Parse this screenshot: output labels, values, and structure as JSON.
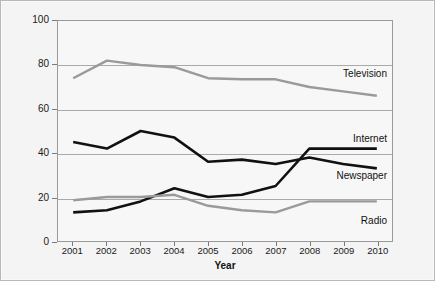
{
  "chart_data": {
    "type": "line",
    "title": "",
    "xlabel": "Year",
    "ylabel": "Percentage",
    "categories": [
      "2001",
      "2002",
      "2003",
      "2004",
      "2005",
      "2006",
      "2007",
      "2008",
      "2009",
      "2010"
    ],
    "x": [
      2001,
      2002,
      2003,
      2004,
      2005,
      2006,
      2007,
      2008,
      2009,
      2010
    ],
    "xlim": [
      2000.55,
      2010.45
    ],
    "ylim": [
      0,
      100
    ],
    "yticks": [
      0,
      20,
      40,
      60,
      80,
      100
    ],
    "ytick_labels": [
      "0",
      "20",
      "40",
      "60",
      "80",
      "100"
    ],
    "grid": true,
    "grid_axis": "y",
    "legend_position": "inline-right",
    "series": [
      {
        "name": "Television",
        "color": "#9a9a9a",
        "width": 2.4,
        "label_anchor_value": 76,
        "values": [
          74,
          82,
          80,
          79,
          74,
          73.5,
          73.5,
          70,
          68,
          66
        ]
      },
      {
        "name": "Newspaper",
        "color": "#111111",
        "width": 2.6,
        "label_anchor_value": 30,
        "values": [
          45,
          42,
          50,
          47,
          36,
          37,
          35,
          38,
          35,
          33
        ]
      },
      {
        "name": "Internet",
        "color": "#111111",
        "width": 2.6,
        "label_anchor_value": 47,
        "values": [
          13,
          14,
          18,
          24,
          20,
          21,
          25,
          42,
          42,
          42
        ]
      },
      {
        "name": "Radio",
        "color": "#9a9a9a",
        "width": 2.4,
        "label_anchor_value": 10,
        "values": [
          18.5,
          20,
          20,
          21,
          16,
          14,
          13,
          18,
          18,
          18
        ]
      }
    ]
  },
  "colors": {
    "figure_background": "#f4f4f4",
    "plot_background": "#f7f7f7",
    "frame": "#9a9a9a",
    "gridline": "#a9a9a9",
    "dark_series": "#111111",
    "light_series": "#9a9a9a",
    "text": "#1a1a1a"
  }
}
